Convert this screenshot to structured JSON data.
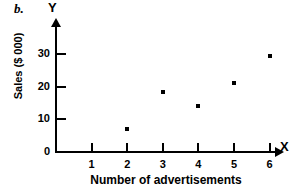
{
  "figure": {
    "part_label": "b.",
    "y_axis_name": "Y",
    "x_axis_name": "X"
  },
  "chart_data": {
    "type": "scatter",
    "title": "",
    "xlabel": "Number of advertisements",
    "ylabel": "Sales ($ 000)",
    "xlim": [
      0,
      6.6
    ],
    "ylim": [
      0,
      34
    ],
    "grid": false,
    "legend": "none",
    "x_ticks": [
      1,
      2,
      3,
      4,
      5,
      6
    ],
    "x_tick_labels": [
      "1",
      "2",
      "3",
      "4",
      "5",
      "6"
    ],
    "y_ticks": [
      0,
      10,
      20,
      30
    ],
    "y_tick_labels": [
      "0",
      "10",
      "20",
      "30"
    ],
    "x": [
      2,
      3,
      4,
      5,
      6
    ],
    "y": [
      7,
      18.5,
      14,
      21,
      29.5
    ],
    "points": [
      {
        "x": 2,
        "y": 7
      },
      {
        "x": 3,
        "y": 18.5
      },
      {
        "x": 4,
        "y": 14
      },
      {
        "x": 5,
        "y": 21
      },
      {
        "x": 6,
        "y": 29.5
      }
    ],
    "marker": "square",
    "marker_color": "#000000"
  }
}
